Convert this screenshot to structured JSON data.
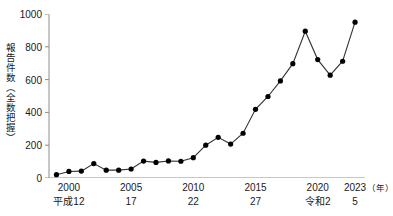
{
  "chart_data": {
    "type": "line",
    "title": "",
    "xlabel": "年",
    "ylabel": "報告件数（全数把握）",
    "ylim": [
      0,
      1000
    ],
    "xlim": [
      1998.4,
      2023.8
    ],
    "grid": false,
    "legend": "none",
    "marker": "filled-circle",
    "line_color": "#333333",
    "marker_color": "#000000",
    "axis_color": "#8c8c8c",
    "background": "#ffffff",
    "x": [
      1999,
      2000,
      2001,
      2002,
      2003,
      2004,
      2005,
      2006,
      2007,
      2008,
      2009,
      2010,
      2011,
      2012,
      2013,
      2014,
      2015,
      2016,
      2017,
      2018,
      2019,
      2020,
      2021,
      2022,
      2023
    ],
    "values": [
      20,
      40,
      42,
      88,
      48,
      48,
      55,
      103,
      95,
      104,
      102,
      124,
      200,
      248,
      207,
      273,
      419,
      497,
      592,
      697,
      895,
      722,
      627,
      712,
      950
    ],
    "yticks": [
      0,
      200,
      400,
      600,
      800,
      1000
    ],
    "ytick_labels": [
      "0",
      "200",
      "400",
      "600",
      "800",
      "1000"
    ],
    "xticks": [
      2000,
      2005,
      2010,
      2015,
      2020,
      2023
    ],
    "xtick_labels_western": [
      "2000",
      "2005",
      "2010",
      "2015",
      "2020",
      "2023"
    ],
    "xtick_labels_era": [
      "平成12",
      "17",
      "22",
      "27",
      "令和2",
      "5"
    ],
    "xaxis_unit": "（年）"
  }
}
